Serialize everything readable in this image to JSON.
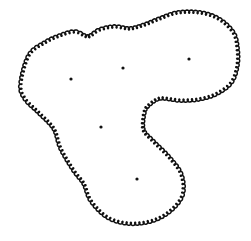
{
  "diagram": {
    "background": "#ffffff",
    "stroke_color": "#111111",
    "dots": [
      {
        "x": 71,
        "y": 79
      },
      {
        "x": 123,
        "y": 68
      },
      {
        "x": 189,
        "y": 59
      },
      {
        "x": 101,
        "y": 127
      },
      {
        "x": 137,
        "y": 179
      }
    ],
    "outline": [
      [
        22,
        84
      ],
      [
        30,
        56
      ],
      [
        45,
        44
      ],
      [
        60,
        37
      ],
      [
        75,
        33
      ],
      [
        88,
        38
      ],
      [
        100,
        31
      ],
      [
        115,
        28
      ],
      [
        130,
        30
      ],
      [
        145,
        26
      ],
      [
        160,
        20
      ],
      [
        178,
        14
      ],
      [
        200,
        14
      ],
      [
        218,
        20
      ],
      [
        232,
        33
      ],
      [
        236,
        48
      ],
      [
        236,
        65
      ],
      [
        230,
        82
      ],
      [
        215,
        93
      ],
      [
        198,
        98
      ],
      [
        180,
        99
      ],
      [
        160,
        97
      ],
      [
        148,
        104
      ],
      [
        143,
        112
      ],
      [
        142,
        130
      ],
      [
        152,
        142
      ],
      [
        168,
        158
      ],
      [
        180,
        175
      ],
      [
        181,
        195
      ],
      [
        168,
        211
      ],
      [
        150,
        220
      ],
      [
        128,
        222
      ],
      [
        108,
        216
      ],
      [
        92,
        200
      ],
      [
        85,
        183
      ],
      [
        75,
        170
      ],
      [
        62,
        148
      ],
      [
        55,
        128
      ],
      [
        40,
        112
      ],
      [
        26,
        98
      ]
    ]
  }
}
